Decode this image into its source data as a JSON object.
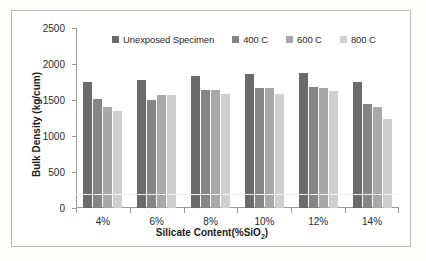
{
  "chart_data": {
    "type": "bar",
    "title": "",
    "xlabel": "Silicate Content(%SiO2)",
    "xlabel_main": "Silicate Content(%SiO",
    "xlabel_sub": "2",
    "xlabel_tail": ")",
    "ylabel": "Bulk Density (kg/cum)",
    "categories": [
      "4%",
      "6%",
      "8%",
      "10%",
      "12%",
      "14%"
    ],
    "ylim": [
      0,
      2500
    ],
    "yticks": [
      0,
      500,
      1000,
      1500,
      2000,
      2500
    ],
    "ytick_labels": [
      "0",
      "500",
      "1000",
      "1500",
      "2000",
      "2500"
    ],
    "grid": false,
    "legend_position": "top",
    "series": [
      {
        "name": "Unexposed Specimen",
        "color": "#6b6b6b",
        "values": [
          1750,
          1780,
          1840,
          1860,
          1870,
          1750
        ]
      },
      {
        "name": "400 C",
        "color": "#858585",
        "values": [
          1520,
          1500,
          1640,
          1660,
          1680,
          1450
        ]
      },
      {
        "name": "600 C",
        "color": "#a8a8a8",
        "values": [
          1400,
          1570,
          1640,
          1660,
          1660,
          1400
        ]
      },
      {
        "name": "800 C",
        "color": "#cfcfcf",
        "values": [
          1350,
          1565,
          1585,
          1590,
          1620,
          1230
        ]
      }
    ]
  }
}
